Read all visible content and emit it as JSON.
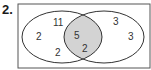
{
  "problem": {
    "number": "2."
  },
  "colors": {
    "frame": "#555555",
    "ellipse_stroke": "#333333",
    "intersection_fill": "#d3d3d3",
    "text": "#333333"
  },
  "venn": {
    "left_only": {
      "values": [
        "11",
        "2",
        "2"
      ]
    },
    "intersection": {
      "values": [
        "5",
        "2"
      ]
    },
    "right_only": {
      "values": [
        "3",
        "3"
      ]
    }
  }
}
